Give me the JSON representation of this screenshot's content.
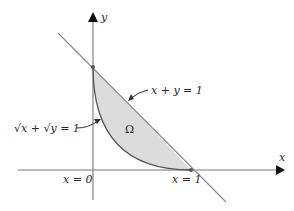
{
  "diagram": {
    "axes": {
      "x_label": "x",
      "y_label": "y"
    },
    "labels": {
      "line_eq": "x + y = 1",
      "curve_eq": "√x + √y = 1",
      "region": "Ω",
      "x_zero": "x = 0",
      "x_one": "x = 1"
    },
    "colors": {
      "region_fill": "#dcdcdc",
      "curve": "#555555",
      "line": "#888888",
      "axis": "#777777",
      "arrow": "#111111"
    }
  }
}
